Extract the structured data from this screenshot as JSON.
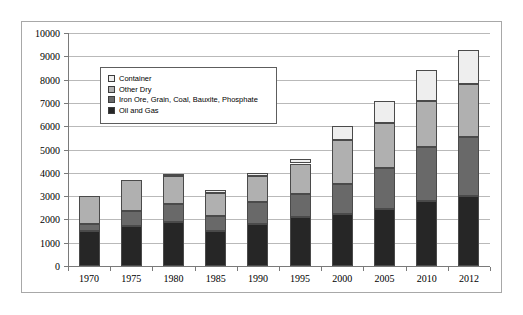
{
  "chart_data": {
    "type": "bar",
    "stacked": true,
    "title": "",
    "xlabel": "",
    "ylabel": "",
    "ylim": [
      0,
      10000
    ],
    "ytick_step": 1000,
    "yticks": [
      0,
      1000,
      2000,
      3000,
      4000,
      5000,
      6000,
      7000,
      8000,
      9000,
      10000
    ],
    "grid": true,
    "legend_position": "upper-left-inside",
    "categories": [
      "1970",
      "1975",
      "1980",
      "1985",
      "1990",
      "1995",
      "2000",
      "2005",
      "2010",
      "2012"
    ],
    "series": [
      {
        "name": "Oil and Gas",
        "color": "#262626",
        "values": [
          1500,
          1700,
          1900,
          1500,
          1800,
          2100,
          2250,
          2450,
          2800,
          3000
        ]
      },
      {
        "name": "Iron Ore, Grain, Coal, Bauxite, Phosphate",
        "color": "#696969",
        "values": [
          300,
          650,
          750,
          650,
          950,
          1000,
          1250,
          1750,
          2300,
          2550
        ]
      },
      {
        "name": "Other Dry",
        "color": "#b0b0b0",
        "values": [
          1200,
          1350,
          1200,
          1000,
          1100,
          1300,
          1900,
          1950,
          2000,
          2250
        ]
      },
      {
        "name": "Container",
        "color": "#eeeeee",
        "values": [
          0,
          0,
          100,
          100,
          150,
          200,
          600,
          950,
          1300,
          1450
        ]
      }
    ],
    "totals": [
      3000,
      3700,
      3950,
      3250,
      4000,
      4600,
      6000,
      7100,
      8400,
      9250
    ]
  },
  "legend": {
    "items": [
      {
        "label": "Container",
        "color": "#eeeeee"
      },
      {
        "label": "Other Dry",
        "color": "#b0b0b0"
      },
      {
        "label": "Iron Ore, Grain, Coal, Bauxite, Phosphate",
        "color": "#696969"
      },
      {
        "label": "Oil and Gas",
        "color": "#262626"
      }
    ]
  },
  "axis": {
    "y_labels": [
      "10000",
      "9000",
      "8000",
      "7000",
      "6000",
      "5000",
      "4000",
      "3000",
      "2000",
      "1000",
      "0"
    ],
    "x_labels": [
      "1970",
      "1975",
      "1980",
      "1985",
      "1990",
      "1995",
      "2000",
      "2005",
      "2010",
      "2012"
    ]
  }
}
